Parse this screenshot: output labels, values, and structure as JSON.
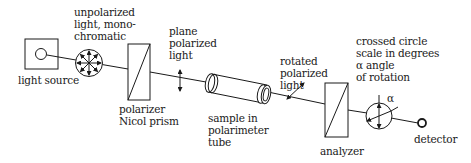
{
  "diagram": {
    "labels": {
      "unpolarized": "unpolarized\nlight, mono-\nchromatic",
      "light_source": "light source",
      "polarizer": "polarizer\nNicol prism",
      "plane_polarized": "plane\npolarized\nlight",
      "sample": "sample in\npolarimeter\ntube",
      "rotated": "rotated\npolarized\nlight",
      "analyzer": "analyzer",
      "scale": "crossed circle\nscale in degrees\nα angle\nof rotation",
      "alpha": "α",
      "detector": "detector"
    },
    "components": [
      {
        "id": "light-source",
        "label": "light source"
      },
      {
        "id": "unpolarized-light",
        "label": "unpolarized light, monochromatic"
      },
      {
        "id": "polarizer",
        "label": "polarizer Nicol prism"
      },
      {
        "id": "plane-polarized-light",
        "label": "plane polarized light"
      },
      {
        "id": "sample-tube",
        "label": "sample in polarimeter tube"
      },
      {
        "id": "rotated-polarized-light",
        "label": "rotated polarized light"
      },
      {
        "id": "analyzer",
        "label": "analyzer"
      },
      {
        "id": "scale",
        "label": "crossed circle scale in degrees, α angle of rotation"
      },
      {
        "id": "detector",
        "label": "detector"
      }
    ],
    "colors": {
      "stroke": "#1a1a1a",
      "background": "#ffffff"
    }
  }
}
